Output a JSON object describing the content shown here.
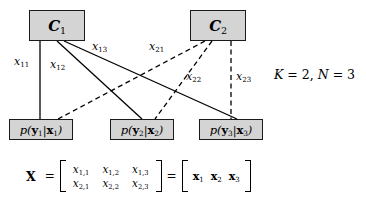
{
  "figure": {
    "type": "factor-graph-diagram",
    "code_nodes": [
      {
        "id": "C1",
        "label_main": "C",
        "label_sub": "1"
      },
      {
        "id": "C2",
        "label_main": "C",
        "label_sub": "2"
      }
    ],
    "channel_nodes": [
      {
        "id": "ch1",
        "text": "p(y₁|x₁)",
        "p": "p(",
        "y": "y",
        "ysub": "1",
        "bar": "|",
        "x": "x",
        "xsub": "1",
        "close": ")"
      },
      {
        "id": "ch2",
        "text": "p(y₂|x₂)",
        "p": "p(",
        "y": "y",
        "ysub": "2",
        "bar": "|",
        "x": "x",
        "xsub": "2",
        "close": ")"
      },
      {
        "id": "ch3",
        "text": "p(y₃|x₃)",
        "p": "p(",
        "y": "y",
        "ysub": "3",
        "bar": "|",
        "x": "x",
        "xsub": "3",
        "close": ")"
      }
    ],
    "edge_labels": [
      {
        "id": "x11",
        "base": "x",
        "sub": "11",
        "style": "solid",
        "from": "C1",
        "to": "ch1"
      },
      {
        "id": "x12",
        "base": "x",
        "sub": "12",
        "style": "solid",
        "from": "C1",
        "to": "ch2"
      },
      {
        "id": "x13",
        "base": "x",
        "sub": "13",
        "style": "solid",
        "from": "C1",
        "to": "ch3"
      },
      {
        "id": "x21",
        "base": "x",
        "sub": "21",
        "style": "dashed",
        "from": "C2",
        "to": "ch1"
      },
      {
        "id": "x22",
        "base": "x",
        "sub": "22",
        "style": "dashed",
        "from": "C2",
        "to": "ch2"
      },
      {
        "id": "x23",
        "base": "x",
        "sub": "23",
        "style": "dashed",
        "from": "C2",
        "to": "ch3"
      }
    ],
    "parameters": {
      "text": "K = 2, N = 3",
      "K_symbol": "K",
      "K_value": "2",
      "N_symbol": "N",
      "N_value": "3",
      "eq": "=",
      "comma": ","
    },
    "matrix_equation": {
      "lhs": "X",
      "eq1": "=",
      "eq2": "=",
      "matrix_rows": [
        [
          {
            "base": "x",
            "sub": "1,1"
          },
          {
            "base": "x",
            "sub": "1,2"
          },
          {
            "base": "x",
            "sub": "1,3"
          }
        ],
        [
          {
            "base": "x",
            "sub": "2,1"
          },
          {
            "base": "x",
            "sub": "2,2"
          },
          {
            "base": "x",
            "sub": "2,3"
          }
        ]
      ],
      "vector": [
        {
          "base": "x",
          "sub": "1"
        },
        {
          "base": "x",
          "sub": "2"
        },
        {
          "base": "x",
          "sub": "3"
        }
      ]
    },
    "colors": {
      "node_fill": "#d4d4d4",
      "node_border": "#1a1a1a",
      "edge": "#000000",
      "background": "#ffffff"
    }
  }
}
